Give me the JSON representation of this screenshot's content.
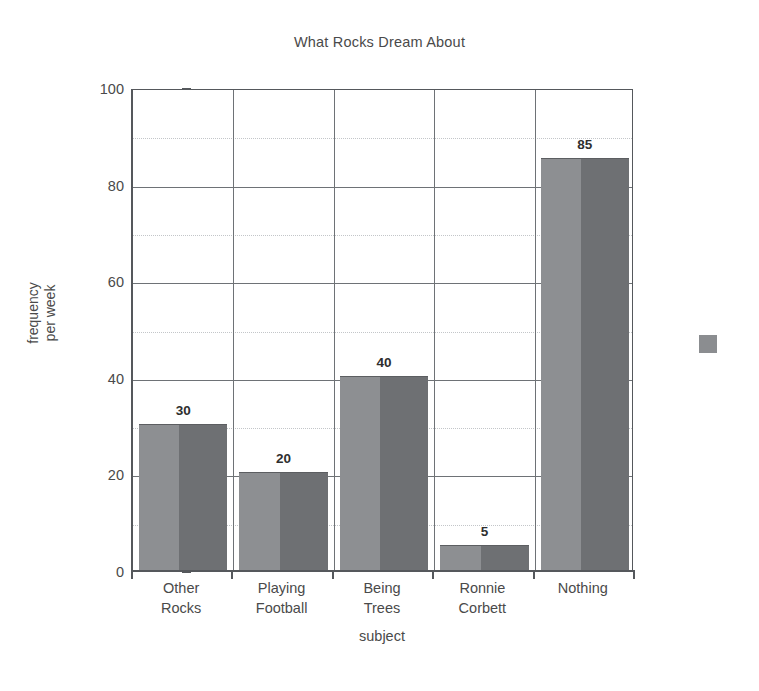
{
  "chart_data": {
    "type": "bar",
    "title": "What Rocks Dream About",
    "xlabel": "subject",
    "ylabel": "frequency per week",
    "ylabel_lines": [
      "frequency",
      "per week"
    ],
    "categories": [
      "Other Rocks",
      "Playing Football",
      "Being Trees",
      "Ronnie Corbett",
      "Nothing"
    ],
    "category_lines": [
      [
        "Other",
        "Rocks"
      ],
      [
        "Playing",
        "Football"
      ],
      [
        "Being",
        "Trees"
      ],
      [
        "Ronnie",
        "Corbett"
      ],
      [
        "Nothing"
      ]
    ],
    "values": [
      30,
      20,
      40,
      5,
      85
    ],
    "value_labels": [
      "30",
      "20",
      "40",
      "5",
      "85"
    ],
    "ylim": [
      0,
      100
    ],
    "ytick_labels": [
      "0",
      "20",
      "40",
      "60",
      "80",
      "100"
    ],
    "ytick_values": [
      0,
      20,
      40,
      60,
      80,
      100
    ],
    "minor_ytick_values": [
      10,
      30,
      50,
      70,
      90
    ],
    "grid": true,
    "legend_position": "right-outside",
    "bar_color_light": "#8d8f92",
    "bar_color_dark": "#6e7073",
    "axis_color": "#55585c",
    "grid_color": "#6e7276",
    "minor_grid_color": "#c3c6c9",
    "text_color": "#4a4a4a"
  }
}
